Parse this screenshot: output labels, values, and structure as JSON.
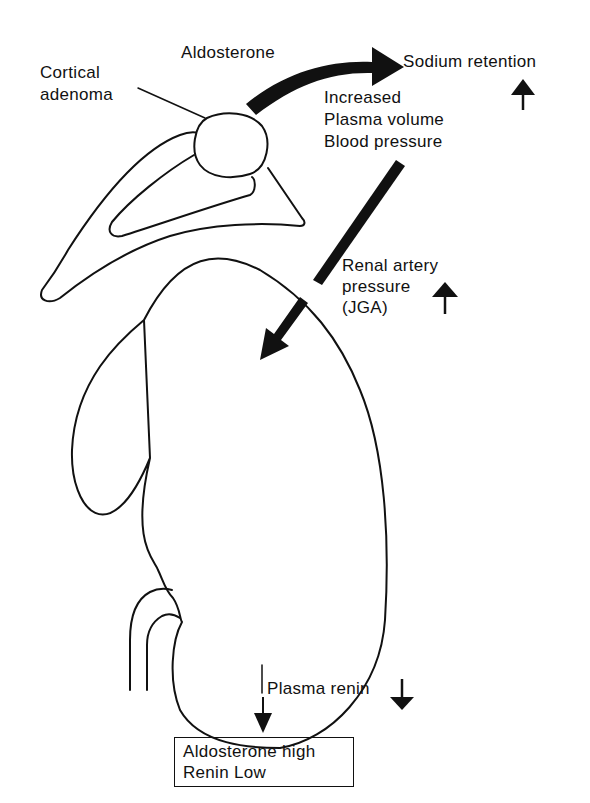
{
  "diagram": {
    "labels": {
      "cortical_adenoma": [
        "Cortical",
        "adenoma"
      ],
      "aldosterone": "Aldosterone",
      "sodium_retention": "Sodium retention",
      "increased_effects": [
        "Increased",
        "Plasma volume",
        "Blood pressure"
      ],
      "renal_artery": [
        "Renal artery",
        "pressure",
        "(JGA)"
      ],
      "plasma_renin": "Plasma renin"
    },
    "result_box": {
      "line1": "Aldosterone high",
      "line2": "Renin Low"
    },
    "indicators": {
      "sodium_retention": "up",
      "renal_artery_pressure": "up",
      "plasma_renin": "down"
    },
    "colors": {
      "ink": "#111111",
      "background": "#ffffff"
    }
  }
}
